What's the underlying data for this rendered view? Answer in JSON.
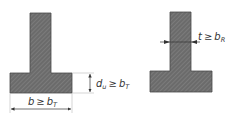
{
  "diagram": {
    "left_section": {
      "shape": "T-section",
      "flange_height_label": {
        "var": "d",
        "sub": "u",
        "op": "≥",
        "rhs_var": "b",
        "rhs_sub": "T"
      },
      "flange_width_label": {
        "var": "b",
        "op": "≥",
        "rhs_var": "b",
        "rhs_sub": "T"
      }
    },
    "right_section": {
      "shape": "T-section",
      "web_thickness_label": {
        "var": "t",
        "op": "≥",
        "rhs_var": "b",
        "rhs_sub": "R"
      }
    },
    "colors": {
      "fill": "#6b6b6b",
      "hatch": "#8a8a8a",
      "outline": "#4a4a4a",
      "dimension": "#333333",
      "extension": "#bbbbbb"
    }
  }
}
